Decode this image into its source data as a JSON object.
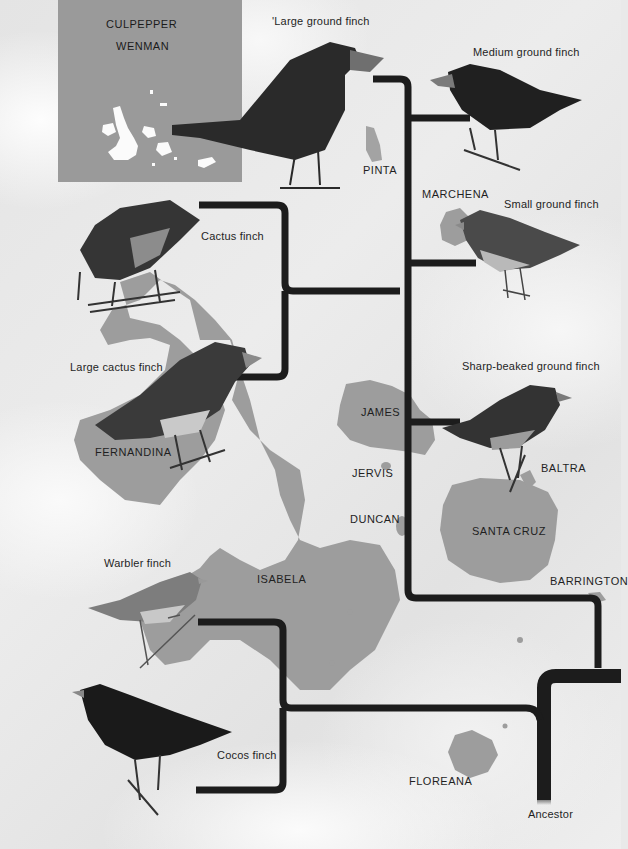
{
  "inset_map": {
    "labels": [
      "CULPEPPER",
      "WENMAN"
    ]
  },
  "islands": {
    "pinta": "PINTA",
    "marchena": "MARCHENA",
    "fernandina": "FERNANDINA",
    "james": "JAMES",
    "jervis": "JERVIS",
    "duncan": "DUNCAN",
    "baltra": "BALTRA",
    "santa_cruz": "SANTA CRUZ",
    "isabela": "ISABELA",
    "barrington": "BARRINGTON",
    "floreana": "FLOREANA"
  },
  "species": {
    "large_ground": "'Large ground finch",
    "medium_ground": "Medium ground finch",
    "small_ground": "Small ground finch",
    "cactus": "Cactus finch",
    "large_cactus": "Large cactus finch",
    "sharp_beaked": "Sharp-beaked ground finch",
    "warbler": "Warbler finch",
    "cocos": "Cocos finch"
  },
  "root": "Ancestor",
  "colors": {
    "branch": "#1c1c1c",
    "island": "#9d9d9d",
    "inset_bg": "#9a9a9a",
    "background": "#e9e9e9"
  }
}
